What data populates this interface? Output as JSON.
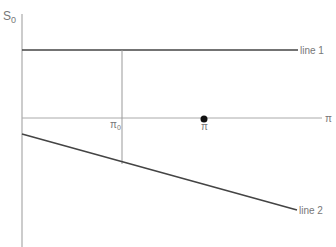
{
  "diagram": {
    "y_axis_label": "S",
    "y_axis_label_sub": "0",
    "x_axis_label": "π",
    "line1_label": "line 1",
    "line2_label": "line 2",
    "pi0_label": "π",
    "pi0_sub": "0",
    "pi_point_label": "π",
    "colors": {
      "axis": "#999999",
      "line1": "#444444",
      "line2": "#444444",
      "pi_line": "#aaaaaa",
      "dot": "#111111",
      "label": "#777777"
    }
  }
}
